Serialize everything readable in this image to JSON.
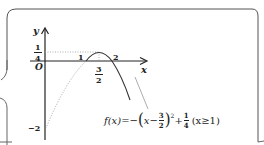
{
  "figure": {
    "axis_labels": {
      "y": "y",
      "x": "x",
      "origin": "O"
    },
    "y_ticks": [
      {
        "label_num": "1",
        "label_den": "4",
        "value": 0.25
      },
      {
        "label": "−2",
        "value": -2
      }
    ],
    "x_ticks": [
      {
        "label": "1",
        "value": 1
      },
      {
        "label": "2",
        "value": 2
      },
      {
        "label_num": "3",
        "label_den": "2",
        "value": 1.5
      }
    ],
    "formula": {
      "lhs": "f(x)",
      "eq": "=−",
      "inner_var": "x−",
      "inner_frac_num": "3",
      "inner_frac_den": "2",
      "exponent": "2",
      "plus": "+",
      "const_num": "1",
      "const_den": "4",
      "domain": "(x≥1)"
    },
    "colors": {
      "stroke": "#333333",
      "dotted": "#888888",
      "border": "#555555"
    }
  }
}
